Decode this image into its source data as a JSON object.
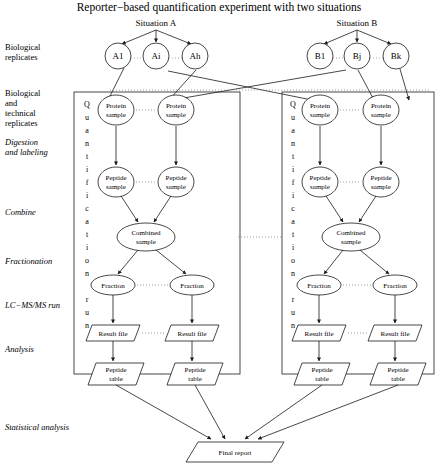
{
  "figure": {
    "title": "Reporter−based quantification experiment with two situations",
    "situations": [
      {
        "label": "Situation A"
      },
      {
        "label": "Situation B"
      }
    ],
    "stage_labels": [
      {
        "id": "biological-replicates",
        "lines": [
          "Biological",
          "replicates"
        ],
        "italic": false
      },
      {
        "id": "biological-and-technical-replicates",
        "lines": [
          "Biological",
          "and",
          "technical",
          "replicates"
        ],
        "italic": false
      },
      {
        "id": "digestion-and-labeling",
        "lines": [
          "Digestion",
          "and labeling"
        ],
        "italic": true
      },
      {
        "id": "combine",
        "lines": [
          "Combine"
        ],
        "italic": true
      },
      {
        "id": "fractionation",
        "lines": [
          "Fractionation"
        ],
        "italic": true
      },
      {
        "id": "lc-ms-ms-run",
        "lines": [
          "LC−MS/MS run"
        ],
        "italic": true
      },
      {
        "id": "analysis",
        "lines": [
          "Analysis"
        ],
        "italic": true
      },
      {
        "id": "statistical-analysis",
        "lines": [
          "Statistical analysis"
        ],
        "italic": true
      }
    ],
    "vertical_label": {
      "text": "Quantification run",
      "letters": [
        "Q",
        "u",
        "a",
        "n",
        "t",
        "i",
        "f",
        "i",
        "c",
        "a",
        "t",
        "i",
        "o",
        "n",
        "",
        "r",
        "u",
        "n"
      ]
    },
    "branches": [
      {
        "id": "situation-a",
        "replicates": [
          "A1",
          "Ai",
          "Ah"
        ],
        "protein_samples": [
          "Protein sample",
          "Protein sample"
        ],
        "peptide_samples": [
          "Peptide sample",
          "Peptide sample"
        ],
        "combined_sample": "Combined sample",
        "fractions": [
          "Fraction",
          "Fraction"
        ],
        "result_files": [
          "Result file",
          "Result file"
        ],
        "peptide_tables": [
          "Peptide table",
          "Peptide table"
        ]
      },
      {
        "id": "situation-b",
        "replicates": [
          "B1",
          "Bj",
          "Bk"
        ],
        "protein_samples": [
          "Protein sample",
          "Protein sample"
        ],
        "peptide_samples": [
          "Peptide sample",
          "Peptide sample"
        ],
        "combined_sample": "Combined sample",
        "fractions": [
          "Fraction",
          "Fraction"
        ],
        "result_files": [
          "Result file",
          "Result file"
        ],
        "peptide_tables": [
          "Peptide table",
          "Peptide table"
        ]
      }
    ],
    "final_report": "Final report",
    "node_text_lines": {
      "protein_sample": [
        "Protein",
        "sample"
      ],
      "peptide_sample": [
        "Peptide",
        "sample"
      ],
      "combined_sample": [
        "Combined",
        "sample"
      ],
      "fraction": [
        "Fraction"
      ],
      "result_file": [
        "Result file"
      ],
      "peptide_table": [
        "Peptide",
        "table"
      ],
      "final_report": [
        "Final report"
      ]
    },
    "colors": {
      "stroke": "#1a1a1a",
      "dotted": "#8a8a8a",
      "background": "#ffffff",
      "text": "#000000"
    }
  }
}
